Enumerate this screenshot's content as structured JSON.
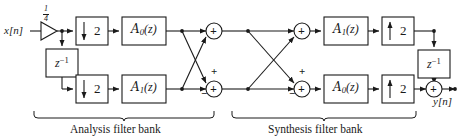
{
  "diagram": {
    "stroke_color": "#1a1a1a",
    "text_color": "#1a1a1a",
    "background": "#ffffff"
  },
  "signals": {
    "input_label": "x[n]",
    "output_label": "y[n]",
    "gain_numerator": "1",
    "gain_denominator": "4"
  },
  "analysis": {
    "section_label": "Analysis filter bank",
    "delay_label_base": "z",
    "delay_label_exp": "−1",
    "down_top": {
      "factor": "2",
      "arrow": "down-arrow-icon"
    },
    "down_bottom": {
      "factor": "2",
      "arrow": "down-arrow-icon"
    },
    "filter_top": {
      "name": "A",
      "sub": "0",
      "arg": "(z)"
    },
    "filter_bottom": {
      "name": "A",
      "sub": "1",
      "arg": "(z)"
    },
    "adder_top": {
      "inside": "+"
    },
    "adder_bottom": {
      "inside": "+",
      "sign_top": "+",
      "sign_bottom": "−"
    }
  },
  "synthesis": {
    "section_label": "Synthesis filter bank",
    "delay_label_base": "z",
    "delay_label_exp": "−1",
    "adder_top": {
      "inside": "+"
    },
    "adder_bottom": {
      "inside": "+",
      "sign_top": "+",
      "sign_bottom": "−"
    },
    "filter_top": {
      "name": "A",
      "sub": "1",
      "arg": "(z)"
    },
    "filter_bottom": {
      "name": "A",
      "sub": "0",
      "arg": "(z)"
    },
    "up_top": {
      "factor": "2",
      "arrow": "up-arrow-icon"
    },
    "up_bottom": {
      "factor": "2",
      "arrow": "up-arrow-icon"
    },
    "adder_output": {
      "inside": "+"
    }
  }
}
